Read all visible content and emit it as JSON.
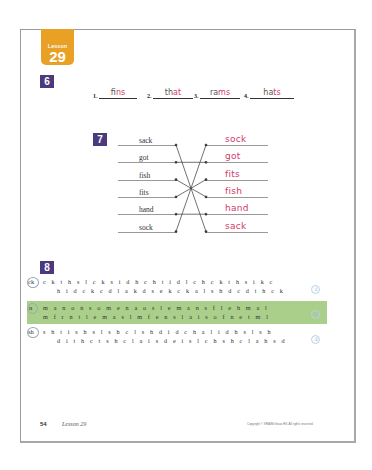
{
  "lesson": {
    "label": "Lesson",
    "number": "29"
  },
  "section6": {
    "badge": "6",
    "items": [
      {
        "num": "1.",
        "printed": "f",
        "written": "ins"
      },
      {
        "num": "2.",
        "printed": "th",
        "written": "at"
      },
      {
        "num": "3.",
        "printed": "ra",
        "written": "ms"
      },
      {
        "num": "4.",
        "printed": "ha",
        "written": "ts"
      }
    ]
  },
  "section7": {
    "badge": "7",
    "left_words": [
      "sack",
      "got",
      "fish",
      "fits",
      "hand",
      "sock"
    ],
    "right_words": [
      "sock",
      "got",
      "fits",
      "fish",
      "hand",
      "sack"
    ],
    "connections": [
      [
        0,
        5
      ],
      [
        1,
        1
      ],
      [
        2,
        3
      ],
      [
        3,
        2
      ],
      [
        4,
        4
      ],
      [
        5,
        0
      ]
    ]
  },
  "section8": {
    "badge": "8",
    "rows": [
      {
        "key": "ck",
        "line1": "c k t h s l c k s i d h c h t i d l c h c k t h s i k c",
        "line2": "h i d c k c d l a k d s e k c k a l s h d c d t h c k",
        "highlighted": false,
        "mark": "①"
      },
      {
        "key": "n",
        "line1": "m a n o n s o m e n a o s l e m a n s f l e h m a l",
        "line2": "m f r n t l e m a s l m f e n s l a i s o f n e t m l",
        "highlighted": true,
        "mark": "②"
      },
      {
        "key": "sh",
        "line1": "s h t i s h s l s h c l s h d i d c h a l i d h s l s h",
        "line2": "d i t h c t s h c l a i s d e i s l c h s h c l a h s d",
        "highlighted": false,
        "mark": "③"
      }
    ],
    "highlight_color": "#a9cf8a"
  },
  "footer": {
    "page_number": "54",
    "lesson_ref": "Lesson 29",
    "copyright": "Copyright © SRA/McGraw-Hill. All rights reserved."
  },
  "colors": {
    "lesson_tab": "#e8a025",
    "badge": "#4b3a7e",
    "handwriting": "#d33a6a"
  }
}
